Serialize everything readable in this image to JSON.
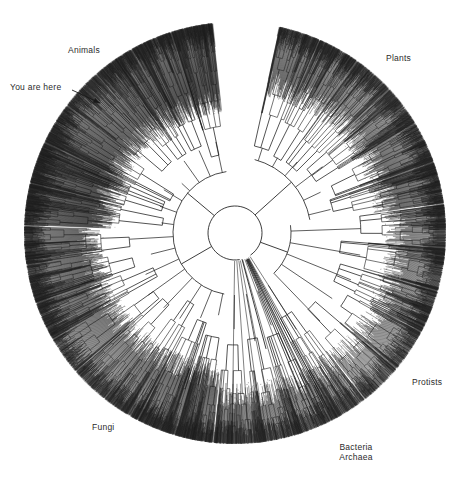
{
  "figure": {
    "title_hidden": "",
    "kind": "radial-phylogenetic-tree",
    "background_color": "#ffffff",
    "ink_color": "#1a1a1a"
  },
  "annotations": {
    "you_are_here": "You are here",
    "animals": "Animals",
    "plants": "Plants",
    "protists": "Protists",
    "bacteria": "Bacteria",
    "archaea": "Archaea",
    "fungi": "Fungi"
  },
  "chart_data": {
    "type": "tree",
    "layout": "radial-circular-cladogram",
    "title": "",
    "xlabel": "",
    "ylabel": "",
    "grid": false,
    "legend": "none",
    "center": [
      235,
      233
    ],
    "outer_radius": 211,
    "root_ring_radius": 27,
    "second_ring_radius": 62,
    "root_gap_angle_deg": [
      55,
      80
    ],
    "tip_count_approx": 3000,
    "annotations": [
      {
        "label": "Animals",
        "x": 86,
        "y": 51,
        "anchor": "middle",
        "angle_deg": 215
      },
      {
        "label": "You are here",
        "x": 42,
        "y": 88,
        "anchor": "middle",
        "angle_deg": 198,
        "arrow": {
          "x1": 72,
          "y1": 90,
          "x2": 100,
          "y2": 103
        }
      },
      {
        "label": "Plants",
        "x": 399,
        "y": 59,
        "anchor": "middle",
        "angle_deg": 325
      },
      {
        "label": "Protists",
        "x": 430,
        "y": 383,
        "anchor": "middle",
        "angle_deg": 35
      },
      {
        "label": "Bacteria",
        "x": 355,
        "y": 450,
        "anchor": "middle",
        "angle_deg": 62
      },
      {
        "label": "Archaea",
        "x": 355,
        "y": 460,
        "anchor": "middle",
        "angle_deg": 66
      },
      {
        "label": "Fungi",
        "x": 105,
        "y": 428,
        "anchor": "middle",
        "angle_deg": 125
      }
    ],
    "clades": [
      {
        "name": "Animals",
        "start_angle_deg": 182,
        "end_angle_deg": 264,
        "tip_density": "very-high"
      },
      {
        "name": "Plants",
        "start_angle_deg": 282,
        "end_angle_deg": 352,
        "tip_density": "high"
      },
      {
        "name": "Protists",
        "start_angle_deg": 352,
        "end_angle_deg": 52,
        "tip_density": "medium"
      },
      {
        "name": "Bacteria and Archaea",
        "start_angle_deg": 52,
        "end_angle_deg": 96,
        "tip_density": "medium"
      },
      {
        "name": "Fungi",
        "start_angle_deg": 96,
        "end_angle_deg": 182,
        "tip_density": "high"
      }
    ]
  }
}
